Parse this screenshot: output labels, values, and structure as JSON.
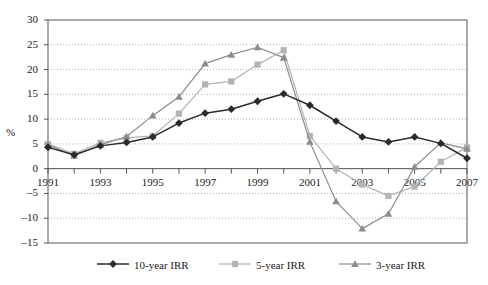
{
  "chart_data": {
    "type": "line",
    "title": "",
    "xlabel": "",
    "ylabel": "%",
    "x": [
      1991,
      1992,
      1993,
      1994,
      1995,
      1996,
      1997,
      1998,
      1999,
      2000,
      2001,
      2002,
      2003,
      2004,
      2005,
      2006,
      2007
    ],
    "xlim": [
      1991,
      2007
    ],
    "ylim": [
      -15,
      30
    ],
    "ytick_values": [
      30,
      25,
      20,
      15,
      10,
      5,
      0,
      -5,
      -10,
      -15
    ],
    "ytick_labels": [
      "30",
      "25",
      "20",
      "15",
      "10",
      "5",
      "0",
      "–5",
      "–10",
      "–15"
    ],
    "xtick_labels": [
      "1991",
      "1993",
      "1995",
      "1997",
      "1999",
      "2001",
      "2003",
      "2005",
      "2007"
    ],
    "xtick_values": [
      1991,
      1993,
      1995,
      1997,
      1999,
      2001,
      2003,
      2005,
      2007
    ],
    "grid": "horizontal-dotted",
    "legend_position": "bottom",
    "series": [
      {
        "name": "10-year IRR",
        "marker": "diamond",
        "color": "#2b2b2b",
        "values": [
          4.3,
          2.8,
          4.6,
          5.3,
          6.4,
          9.2,
          11.2,
          12.0,
          13.6,
          15.1,
          12.8,
          9.6,
          6.4,
          5.4,
          6.4,
          5.1,
          2.1
        ]
      },
      {
        "name": "5-year IRR",
        "marker": "square",
        "color": "#b3b3b3",
        "values": [
          5.0,
          3.0,
          5.2,
          6.2,
          6.6,
          11.1,
          17.0,
          17.6,
          21.0,
          23.9,
          6.6,
          0.0,
          -3.2,
          -5.5,
          -3.6,
          1.4,
          4.3
        ]
      },
      {
        "name": "3-year IRR",
        "marker": "triangle",
        "color": "#8c8c8c",
        "values": [
          4.8,
          2.6,
          4.8,
          6.5,
          10.7,
          14.5,
          21.2,
          23.0,
          24.5,
          22.4,
          5.4,
          -6.6,
          -12.1,
          -9.1,
          0.4,
          5.2,
          4.0
        ]
      }
    ]
  },
  "legend": {
    "items": [
      {
        "label": "10-year IRR"
      },
      {
        "label": "5-year IRR"
      },
      {
        "label": "3-year IRR"
      }
    ]
  },
  "axis": {
    "y_axis_title": "%"
  }
}
